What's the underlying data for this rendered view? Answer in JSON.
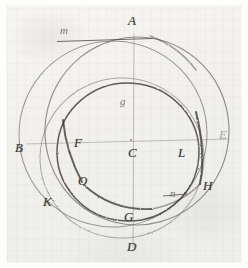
{
  "figure": {
    "medium": "pencil on ruled paper",
    "ink_color": "#4a4741",
    "paper_color": "#f2f1ed"
  },
  "labels": [
    {
      "id": "m",
      "text": "m",
      "x": 60,
      "y": 25,
      "size": "small",
      "tone": "faint",
      "role": "tangent-line-label"
    },
    {
      "id": "A",
      "text": "A",
      "x": 128,
      "y": 14,
      "size": "cap",
      "tone": "normal",
      "role": "top-point"
    },
    {
      "id": "g",
      "text": "g",
      "x": 120,
      "y": 96,
      "size": "small",
      "tone": "faint",
      "role": "upper-inner-point"
    },
    {
      "id": "E",
      "text": "E",
      "x": 219,
      "y": 128,
      "size": "cap",
      "tone": "vfaint",
      "role": "right-point"
    },
    {
      "id": "B",
      "text": "B",
      "x": 15,
      "y": 141,
      "size": "cap",
      "tone": "normal",
      "role": "left-point"
    },
    {
      "id": "F",
      "text": "F",
      "x": 74,
      "y": 136,
      "size": "cap",
      "tone": "normal",
      "role": "upper-left-intersection"
    },
    {
      "id": "C",
      "text": "C",
      "x": 128,
      "y": 146,
      "size": "cap",
      "tone": "normal",
      "role": "center-point"
    },
    {
      "id": "L",
      "text": "L",
      "x": 178,
      "y": 146,
      "size": "cap",
      "tone": "normal",
      "role": "right-intersection"
    },
    {
      "id": "O",
      "text": "O",
      "x": 78,
      "y": 174,
      "size": "cap",
      "tone": "normal",
      "role": "lower-left-intersection"
    },
    {
      "id": "H",
      "text": "H",
      "x": 203,
      "y": 179,
      "size": "cap",
      "tone": "normal",
      "role": "lower-right-point"
    },
    {
      "id": "n",
      "text": "n",
      "x": 170,
      "y": 188,
      "size": "small",
      "tone": "faint",
      "role": "underlined-point"
    },
    {
      "id": "K",
      "text": "K",
      "x": 43,
      "y": 195,
      "size": "cap",
      "tone": "normal",
      "role": "lower-left-point"
    },
    {
      "id": "G",
      "text": "G",
      "x": 124,
      "y": 210,
      "size": "cap",
      "tone": "normal",
      "role": "bottom-inner-point"
    },
    {
      "id": "D",
      "text": "D",
      "x": 127,
      "y": 240,
      "size": "cap",
      "tone": "normal",
      "role": "bottom-point"
    }
  ],
  "geometry": {
    "axes": [
      {
        "name": "vertical-axis-A-D",
        "x1": 134,
        "y1": 34,
        "x2": 133,
        "y2": 248
      },
      {
        "name": "horizontal-axis-B-E",
        "x1": 26,
        "y1": 144,
        "x2": 228,
        "y2": 139
      },
      {
        "name": "tangent-line-m",
        "x1": 57,
        "y1": 41,
        "x2": 150,
        "y2": 38
      },
      {
        "name": "underline-n",
        "x1": 163,
        "y1": 196,
        "x2": 186,
        "y2": 194
      }
    ],
    "circles": [
      {
        "name": "outer-circle-left",
        "cx": 113,
        "cy": 134,
        "r": 94,
        "weight": 1.0,
        "opacity": 0.6
      },
      {
        "name": "outer-circle-right",
        "cx": 137,
        "cy": 132,
        "r": 92,
        "weight": 1.1,
        "opacity": 0.62
      },
      {
        "name": "inner-circle-main",
        "cx": 128,
        "cy": 152,
        "r": 70,
        "weight": 1.4,
        "opacity": 0.8
      },
      {
        "name": "lower-circle",
        "cx": 121,
        "cy": 160,
        "r": 80,
        "weight": 1.0,
        "opacity": 0.55
      }
    ]
  }
}
